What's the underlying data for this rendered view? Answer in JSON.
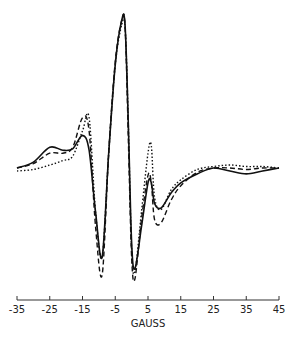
{
  "chart_data": {
    "type": "line",
    "title": "",
    "xlabel": "GAUSS",
    "ylabel": "",
    "xlim": [
      -35,
      45
    ],
    "x_ticks": [
      "-35",
      "-25",
      "-15",
      "-5",
      "5",
      "15",
      "25",
      "35",
      "45"
    ],
    "grid": false,
    "legend": "none",
    "series": [
      {
        "name": "solid",
        "style": "solid",
        "x": [
          -35,
          -30,
          -25,
          -21,
          -18,
          -15,
          -13,
          -11,
          -9,
          -7,
          -5,
          -3,
          -2,
          -1,
          0,
          1,
          3,
          5,
          6,
          7,
          9,
          12,
          15,
          20,
          25,
          30,
          35,
          40,
          45
        ],
        "y": [
          0,
          0.04,
          0.14,
          0.12,
          0.13,
          0.22,
          0.12,
          -0.3,
          -0.6,
          0.1,
          0.7,
          1.0,
          0.96,
          0.3,
          -0.5,
          -0.68,
          -0.4,
          -0.1,
          -0.1,
          -0.24,
          -0.27,
          -0.17,
          -0.1,
          -0.04,
          0,
          -0.02,
          -0.04,
          -0.02,
          0
        ]
      },
      {
        "name": "dashed",
        "style": "dashed",
        "x": [
          -35,
          -30,
          -25,
          -21,
          -18,
          -15,
          -13,
          -11,
          -9,
          -7,
          -5,
          -3,
          -2,
          -1,
          0,
          1,
          3,
          5,
          6,
          7,
          9,
          12,
          15,
          20,
          25,
          30,
          35,
          40,
          45
        ],
        "y": [
          0,
          0.03,
          0.1,
          0.1,
          0.14,
          0.34,
          0.25,
          -0.4,
          -0.72,
          0.1,
          0.72,
          1.0,
          0.95,
          0.2,
          -0.6,
          -0.75,
          -0.35,
          -0.05,
          -0.1,
          -0.35,
          -0.37,
          -0.22,
          -0.12,
          -0.03,
          0,
          0,
          -0.01,
          0,
          0
        ]
      },
      {
        "name": "dotted",
        "style": "dotted",
        "x": [
          -35,
          -30,
          -25,
          -21,
          -18,
          -15,
          -13,
          -11,
          -9,
          -7,
          -5,
          -3,
          -2,
          -1,
          0,
          1,
          3,
          5,
          6,
          7,
          9,
          12,
          15,
          20,
          25,
          30,
          35,
          40,
          45
        ],
        "y": [
          -0.02,
          -0.01,
          0.02,
          0.05,
          0.08,
          0.25,
          0.34,
          -0.3,
          -0.6,
          0.1,
          0.7,
          0.97,
          0.95,
          0.3,
          -0.55,
          -0.7,
          -0.3,
          0.1,
          0.15,
          -0.2,
          -0.28,
          -0.15,
          -0.08,
          -0.01,
          0.01,
          0.02,
          0.01,
          0.01,
          0
        ]
      }
    ]
  }
}
